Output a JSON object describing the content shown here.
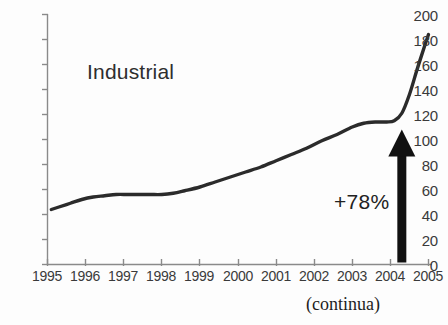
{
  "chart_data": {
    "type": "line",
    "title": "Industrial",
    "xlabel": "",
    "ylabel": "",
    "xlim": [
      1995,
      2005
    ],
    "ylim": [
      0,
      200
    ],
    "grid": false,
    "legend": "none",
    "y_ticks": [
      200,
      180,
      160,
      140,
      120,
      100,
      80,
      60,
      40,
      20,
      0
    ],
    "x_ticks": [
      "1995",
      "1996",
      "1997",
      "1998",
      "1999",
      "2000",
      "2001",
      "2002",
      "2003",
      "2004",
      "2005"
    ],
    "series": [
      {
        "name": "Industrial",
        "color": "#2b2b2b",
        "x": [
          1995.1,
          1995.3,
          1995.6,
          1995.9,
          1996.2,
          1996.5,
          1996.8,
          1997.1,
          1997.4,
          1997.7,
          1998.0,
          1998.3,
          1998.6,
          1999.0,
          1999.4,
          1999.8,
          2000.2,
          2000.6,
          2001.0,
          2001.4,
          2001.8,
          2002.2,
          2002.6,
          2003.0,
          2003.3,
          2003.6,
          2003.9,
          2004.1,
          2004.3,
          2004.5,
          2004.7,
          2004.9,
          2005.0
        ],
        "values": [
          44,
          46,
          49,
          52,
          54,
          55,
          56,
          56,
          56,
          56,
          56,
          57,
          59,
          62,
          66,
          70,
          74,
          78,
          83,
          88,
          93,
          99,
          104,
          110,
          113,
          114,
          114,
          115,
          121,
          136,
          156,
          175,
          184
        ]
      }
    ],
    "annotations": [
      {
        "name": "growth-arrow",
        "label": "+78%",
        "shape": "up-arrow",
        "color": "#111111",
        "x": 2004.3,
        "y_from": 0,
        "y_to": 108
      }
    ],
    "caption": "(continua)"
  },
  "axis": {
    "line_color": "#8a8a8a",
    "tick_color": "#8a8a8a"
  }
}
